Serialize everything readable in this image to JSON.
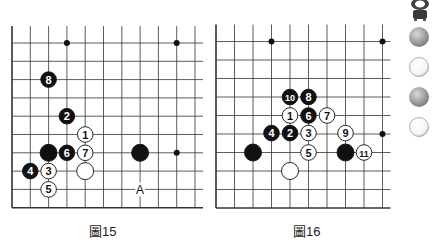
{
  "diagrams": [
    {
      "caption": "圖15",
      "origin": {
        "x": 12,
        "y": 43
      },
      "spacing": 18.3,
      "cols": 11,
      "rows": 10,
      "open_top": true,
      "open_right": true,
      "star_points": [
        [
          3,
          0
        ],
        [
          9,
          0
        ],
        [
          9,
          6
        ]
      ],
      "stones": [
        {
          "col": 2,
          "row": 2,
          "color": "black",
          "label": "8"
        },
        {
          "col": 3,
          "row": 4,
          "color": "black",
          "label": "2"
        },
        {
          "col": 4,
          "row": 5,
          "color": "white",
          "label": "1"
        },
        {
          "col": 2,
          "row": 6,
          "color": "black",
          "label": "",
          "big": true
        },
        {
          "col": 3,
          "row": 6,
          "color": "black",
          "label": "6"
        },
        {
          "col": 4,
          "row": 6,
          "color": "white",
          "label": "7"
        },
        {
          "col": 7,
          "row": 6,
          "color": "black",
          "label": "",
          "big": true
        },
        {
          "col": 1,
          "row": 7,
          "color": "black",
          "label": "4"
        },
        {
          "col": 2,
          "row": 7,
          "color": "white",
          "label": "3"
        },
        {
          "col": 4,
          "row": 7,
          "color": "white",
          "label": "",
          "big": true
        },
        {
          "col": 2,
          "row": 8,
          "color": "white",
          "label": "5"
        }
      ],
      "marks": [
        {
          "col": 7,
          "row": 8,
          "label": "A"
        }
      ]
    },
    {
      "caption": "圖16",
      "origin": {
        "x": 216,
        "y": 41.5
      },
      "spacing": 18.5,
      "cols": 10,
      "rows": 10,
      "open_top": true,
      "open_right": true,
      "star_points": [
        [
          3,
          0
        ],
        [
          9,
          0
        ],
        [
          3,
          5
        ],
        [
          9,
          5
        ]
      ],
      "stones": [
        {
          "col": 4,
          "row": 3,
          "color": "black",
          "label": "10"
        },
        {
          "col": 5,
          "row": 3,
          "color": "black",
          "label": "8"
        },
        {
          "col": 4,
          "row": 4,
          "color": "white",
          "label": "1"
        },
        {
          "col": 5,
          "row": 4,
          "color": "black",
          "label": "6"
        },
        {
          "col": 6,
          "row": 4,
          "color": "white",
          "label": "7"
        },
        {
          "col": 3,
          "row": 4.95,
          "color": "black",
          "label": "4"
        },
        {
          "col": 4,
          "row": 4.95,
          "color": "black",
          "label": "2"
        },
        {
          "col": 5,
          "row": 4.95,
          "color": "white",
          "label": "3"
        },
        {
          "col": 7,
          "row": 4.95,
          "color": "white",
          "label": "9"
        },
        {
          "col": 2,
          "row": 6,
          "color": "black",
          "label": "",
          "big": true
        },
        {
          "col": 5,
          "row": 6,
          "color": "white",
          "label": "5"
        },
        {
          "col": 7,
          "row": 6,
          "color": "black",
          "label": "",
          "big": true
        },
        {
          "col": 8,
          "row": 6,
          "color": "white",
          "label": "11"
        },
        {
          "col": 4,
          "row": 7,
          "color": "white",
          "label": "",
          "big": true
        }
      ],
      "marks": []
    }
  ],
  "sidebar": {
    "items": [
      {
        "type": "mascot"
      },
      {
        "type": "stone",
        "color": "gray"
      },
      {
        "type": "stone",
        "color": "white"
      },
      {
        "type": "stone",
        "color": "gray"
      },
      {
        "type": "stone",
        "color": "white"
      }
    ]
  }
}
